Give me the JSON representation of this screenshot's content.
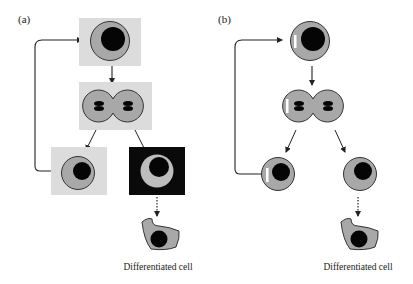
{
  "figure": {
    "colors": {
      "background": "#ffffff",
      "niche_box": "#dcdcdc",
      "niche_box_dark": "#0a0a0a",
      "cytoplasm": "#a8a8a8",
      "cytoplasm_light": "#bdbdbd",
      "nucleus": "#050505",
      "outline": "#333333",
      "marker": "#ffffff"
    },
    "panels": [
      {
        "label": "(a)",
        "type": "niche-based asymmetric division",
        "stages": [
          "stem cell in niche",
          "dividing cell",
          "self-renewed stem cell (niche)",
          "daughter leaving niche",
          "differentiated cell"
        ],
        "caption": "Differentiated cell"
      },
      {
        "label": "(b)",
        "type": "intrinsic asymmetric division (segregated determinant)",
        "stages": [
          "stem cell with marker",
          "dividing cell with marker",
          "daughter retaining marker",
          "daughter without marker",
          "differentiated cell"
        ],
        "caption": "Differentiated cell"
      }
    ]
  }
}
